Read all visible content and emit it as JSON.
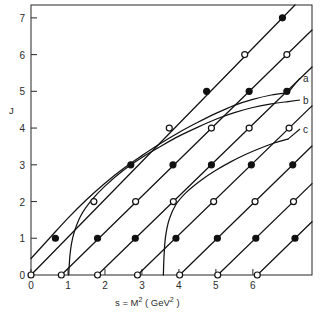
{
  "figure": {
    "title": "",
    "xlabel": "s = M² ( GeV² )",
    "ylabel": "J",
    "xlabel_parts": {
      "lead": "s = M",
      "sup1": "2",
      "mid": " ( GeV",
      "sup2": "2",
      "tail": " )"
    }
  },
  "axes": {
    "x_ticks": [
      "0",
      "1",
      "2",
      "3",
      "4",
      "5",
      "6"
    ],
    "y_ticks": [
      "0",
      "1",
      "2",
      "3",
      "4",
      "5",
      "6",
      "7"
    ],
    "xlim": [
      0,
      7.6
    ],
    "ylim": [
      0,
      7.35
    ]
  },
  "curve_labels": [
    {
      "id": "a",
      "text": "a"
    },
    {
      "id": "b",
      "text": "b"
    },
    {
      "id": "c",
      "text": "c"
    }
  ],
  "chart_data": {
    "type": "line",
    "title": "",
    "xlabel": "s = M² ( GeV² )",
    "ylabel": "J",
    "xlim": [
      0,
      7.6
    ],
    "ylim": [
      0,
      7.35
    ],
    "xticks": [
      0,
      1,
      2,
      3,
      4,
      5,
      6
    ],
    "yticks": [
      0,
      1,
      2,
      3,
      4,
      5,
      6,
      7
    ],
    "grid": false,
    "legend": "inline-right-edge",
    "marker_scheme": {
      "even_J": "open-circle",
      "odd_J": "filled-circle",
      "note": "markers placed at integer J on each straight trajectory"
    },
    "series": [
      {
        "name": "trajectory-1",
        "kind": "linear",
        "intercept_s0": 0.0,
        "slope": 1.07,
        "points": [
          {
            "s": 0.0,
            "J": 0,
            "marker": "open"
          },
          {
            "s": 0.66,
            "J": 1,
            "marker": "filled"
          },
          {
            "s": 1.7,
            "J": 2,
            "marker": "open"
          },
          {
            "s": 2.7,
            "J": 3,
            "marker": "filled"
          },
          {
            "s": 3.74,
            "J": 4,
            "marker": "open"
          },
          {
            "s": 4.75,
            "J": 5,
            "marker": "filled"
          },
          {
            "s": 5.78,
            "J": 6,
            "marker": "open"
          },
          {
            "s": 6.8,
            "J": 7,
            "marker": "filled"
          }
        ]
      },
      {
        "name": "trajectory-2",
        "kind": "linear",
        "intercept_s0": 0.82,
        "slope": 1.07,
        "points": [
          {
            "s": 0.82,
            "J": 0,
            "marker": "open"
          },
          {
            "s": 1.8,
            "J": 1,
            "marker": "filled"
          },
          {
            "s": 2.83,
            "J": 2,
            "marker": "open"
          },
          {
            "s": 3.84,
            "J": 3,
            "marker": "filled"
          },
          {
            "s": 4.88,
            "J": 4,
            "marker": "open"
          },
          {
            "s": 5.9,
            "J": 5,
            "marker": "filled"
          },
          {
            "s": 6.92,
            "J": 6,
            "marker": "open"
          }
        ]
      },
      {
        "name": "trajectory-3",
        "kind": "linear",
        "intercept_s0": 1.8,
        "slope": 1.07,
        "points": [
          {
            "s": 1.8,
            "J": 0,
            "marker": "open"
          },
          {
            "s": 2.82,
            "J": 1,
            "marker": "filled"
          },
          {
            "s": 3.85,
            "J": 2,
            "marker": "open"
          },
          {
            "s": 4.88,
            "J": 3,
            "marker": "filled"
          },
          {
            "s": 5.9,
            "J": 4,
            "marker": "open"
          },
          {
            "s": 6.92,
            "J": 5,
            "marker": "filled"
          }
        ]
      },
      {
        "name": "trajectory-4",
        "kind": "linear",
        "intercept_s0": 2.88,
        "slope": 1.07,
        "points": [
          {
            "s": 2.88,
            "J": 0,
            "marker": "open"
          },
          {
            "s": 3.92,
            "J": 1,
            "marker": "filled"
          },
          {
            "s": 4.94,
            "J": 2,
            "marker": "open"
          },
          {
            "s": 5.96,
            "J": 3,
            "marker": "filled"
          },
          {
            "s": 6.98,
            "J": 4,
            "marker": "open"
          }
        ]
      },
      {
        "name": "trajectory-5",
        "kind": "linear",
        "intercept_s0": 4.02,
        "slope": 1.07,
        "points": [
          {
            "s": 4.02,
            "J": 0,
            "marker": "open"
          },
          {
            "s": 5.04,
            "J": 1,
            "marker": "filled"
          },
          {
            "s": 6.06,
            "J": 2,
            "marker": "open"
          },
          {
            "s": 7.08,
            "J": 3,
            "marker": "filled"
          }
        ]
      },
      {
        "name": "trajectory-6",
        "kind": "linear",
        "intercept_s0": 5.05,
        "slope": 1.07,
        "points": [
          {
            "s": 5.05,
            "J": 0,
            "marker": "open"
          },
          {
            "s": 6.08,
            "J": 1,
            "marker": "filled"
          },
          {
            "s": 7.1,
            "J": 2,
            "marker": "open"
          }
        ]
      },
      {
        "name": "trajectory-7",
        "kind": "linear",
        "intercept_s0": 6.12,
        "slope": 1.07,
        "points": [
          {
            "s": 6.12,
            "J": 0,
            "marker": "open"
          },
          {
            "s": 7.14,
            "J": 1,
            "marker": "filled"
          }
        ]
      },
      {
        "name": "curve-a",
        "label": "a",
        "kind": "saturating",
        "points": [
          {
            "s": 0.0,
            "J": 0.45
          },
          {
            "s": 0.5,
            "J": 1.0
          },
          {
            "s": 1.0,
            "J": 1.55
          },
          {
            "s": 1.5,
            "J": 2.05
          },
          {
            "s": 2.0,
            "J": 2.5
          },
          {
            "s": 2.5,
            "J": 2.9
          },
          {
            "s": 3.0,
            "J": 3.25
          },
          {
            "s": 3.5,
            "J": 3.58
          },
          {
            "s": 4.0,
            "J": 3.88
          },
          {
            "s": 4.5,
            "J": 4.15
          },
          {
            "s": 5.0,
            "J": 4.4
          },
          {
            "s": 5.5,
            "J": 4.62
          },
          {
            "s": 6.0,
            "J": 4.78
          },
          {
            "s": 6.5,
            "J": 4.9
          },
          {
            "s": 6.95,
            "J": 4.96
          }
        ]
      },
      {
        "name": "curve-b",
        "label": "b",
        "kind": "threshold",
        "points": [
          {
            "s": 1.02,
            "J": 0.0
          },
          {
            "s": 1.06,
            "J": 0.6
          },
          {
            "s": 1.15,
            "J": 1.1
          },
          {
            "s": 1.35,
            "J": 1.62
          },
          {
            "s": 1.65,
            "J": 2.05
          },
          {
            "s": 2.0,
            "J": 2.42
          },
          {
            "s": 2.5,
            "J": 2.85
          },
          {
            "s": 3.0,
            "J": 3.2
          },
          {
            "s": 3.5,
            "J": 3.5
          },
          {
            "s": 4.0,
            "J": 3.78
          },
          {
            "s": 4.5,
            "J": 4.02
          },
          {
            "s": 5.0,
            "J": 4.24
          },
          {
            "s": 5.5,
            "J": 4.42
          },
          {
            "s": 6.0,
            "J": 4.56
          },
          {
            "s": 6.5,
            "J": 4.66
          },
          {
            "s": 6.95,
            "J": 4.72
          }
        ]
      },
      {
        "name": "curve-c",
        "label": "c",
        "kind": "threshold",
        "points": [
          {
            "s": 3.58,
            "J": 0.0
          },
          {
            "s": 3.6,
            "J": 0.55
          },
          {
            "s": 3.64,
            "J": 1.05
          },
          {
            "s": 3.74,
            "J": 1.52
          },
          {
            "s": 3.92,
            "J": 1.92
          },
          {
            "s": 4.2,
            "J": 2.25
          },
          {
            "s": 4.6,
            "J": 2.58
          },
          {
            "s": 5.0,
            "J": 2.85
          },
          {
            "s": 5.4,
            "J": 3.08
          },
          {
            "s": 5.8,
            "J": 3.28
          },
          {
            "s": 6.2,
            "J": 3.45
          },
          {
            "s": 6.6,
            "J": 3.6
          },
          {
            "s": 6.95,
            "J": 3.7
          }
        ]
      }
    ]
  }
}
